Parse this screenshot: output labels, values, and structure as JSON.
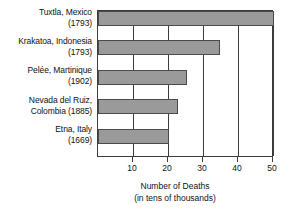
{
  "chart_data": {
    "type": "bar",
    "orientation": "horizontal",
    "title": "",
    "xlabel": "Number of Deaths",
    "xlabel_sub": "(in tens of thousands)",
    "ylabel": "",
    "xlim": [
      0,
      53
    ],
    "xticks": [
      10,
      20,
      30,
      40,
      50
    ],
    "xtick_labels": [
      "10",
      "20",
      "30",
      "40",
      "50"
    ],
    "grid": "vertical",
    "legend": "none",
    "bar_color": "#9a9a9a",
    "bar_edge_color": "#4a4a4a",
    "axis_color": "#3b3b3b",
    "categories": [
      "Tuxtla, Mexico (1793)",
      "Krakatoa, Indonesia (1793)",
      "Pelée, Martinique (1902)",
      "Nevada del Ruiz, Colombia (1885)",
      "Etna, Italy (1669)"
    ],
    "values": [
      50,
      34.5,
      25,
      22.5,
      20
    ],
    "bars": [
      {
        "place": "Tuxtla, Mexico",
        "year": "(1793)",
        "value": 50
      },
      {
        "place": "Krakatoa, Indonesia",
        "year": "(1793)",
        "value": 34.5
      },
      {
        "place": "Pelée, Martinique",
        "year": "(1902)",
        "value": 25
      },
      {
        "place": "Nevada del Ruiz,",
        "year": "Colombia (1885)",
        "value": 22.5
      },
      {
        "place": "Etna, Italy",
        "year": "(1669)",
        "value": 20
      }
    ]
  },
  "category_labels": [
    {
      "line1": "Tuxtla, Mexico",
      "line2": "(1793)"
    },
    {
      "line1": "Krakatoa, Indonesia",
      "line2": "(1793)"
    },
    {
      "line1": "Pelée, Martinique",
      "line2": "(1902)"
    },
    {
      "line1": "Nevada del Ruiz,",
      "line2": "Colombia (1885)"
    },
    {
      "line1": "Etna, Italy",
      "line2": "(1669)"
    }
  ],
  "xticks": [
    {
      "label": "10",
      "value": 10
    },
    {
      "label": "20",
      "value": 20
    },
    {
      "label": "30",
      "value": 30
    },
    {
      "label": "40",
      "value": 40
    },
    {
      "label": "50",
      "value": 50
    }
  ],
  "axis_title": {
    "line1": "Number of Deaths",
    "line2": "(in tens of thousands)"
  }
}
